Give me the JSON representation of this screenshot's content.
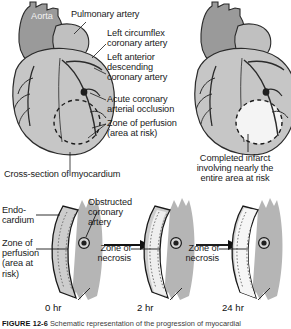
{
  "figure": {
    "caption_id": "FIGURE 12-6",
    "caption_text": "Schematic representation of the progression of myocardial"
  },
  "palette": {
    "heart_muscle": "#c6c6c6",
    "heart_muscle_dark": "#9d9d9d",
    "aorta": "#9a9a9a",
    "pulmonary_artery": "#c0c0c0",
    "vessel_outline": "#2b2b2b",
    "infarct_pale": "#f4f4f4",
    "necrosis_pale": "#efefef",
    "myocardium_fill": "#cdcdcd",
    "epicardial_fat": "#b5b5b5",
    "occlusion_dark": "#1f1f1f",
    "text": "#1a1a1a",
    "background": "#ffffff"
  },
  "top_left_heart": {
    "name": "intact-heart-with-area-at-risk",
    "labels": {
      "aorta": "Aorta",
      "pulmonary_artery": "Pulmonary artery",
      "left_circumflex": "Left circumflex\ncoronary artery",
      "left_anterior_descending": "Left anterior\ndescending\ncoronary artery",
      "acute_occlusion": "Acute coronary\narterial occlusion",
      "zone_of_perfusion": "Zone of perfusion\n(area at risk)"
    }
  },
  "top_right_heart": {
    "name": "heart-with-completed-infarct",
    "labels": {
      "completed_infarct": "Completed infarct\ninvolving nearly the\nentire area at risk"
    }
  },
  "cross_section": {
    "heading": "Cross-section of myocardium",
    "labels": {
      "endocardium": "Endo-\ncardium",
      "zone_of_perfusion": "Zone of\nperfusion\n(area at\nrisk)",
      "obstructed_artery": "Obstructed\ncoronary\nartery",
      "zone_of_necrosis_1": "Zone of\nnecrosis",
      "zone_of_necrosis_2": "Zone of\nnecrosis"
    },
    "panels": [
      {
        "name": "panel-0hr",
        "time": "0 hr",
        "necrosis_extent": "none",
        "description": "Entire wall segment is area at risk; no necrosis yet"
      },
      {
        "name": "panel-2hr",
        "time": "2 hr",
        "necrosis_extent": "subendocardial",
        "description": "Necrosis begins in the subendocardial zone"
      },
      {
        "name": "panel-24hr",
        "time": "24 hr",
        "necrosis_extent": "near-transmural",
        "description": "Necrosis extends through nearly the full wall thickness"
      }
    ]
  }
}
